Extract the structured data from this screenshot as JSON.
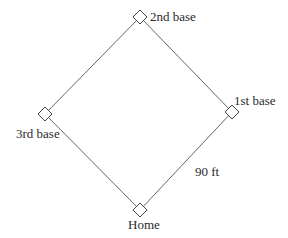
{
  "diagram": {
    "type": "baseball-diamond",
    "colors": {
      "line": "#555555",
      "text": "#2a2a2a",
      "background": "#ffffff"
    },
    "bases": [
      {
        "id": "second",
        "label": "2nd base",
        "cx": 140,
        "cy": 17
      },
      {
        "id": "first",
        "label": "1st base",
        "cx": 232,
        "cy": 112
      },
      {
        "id": "third",
        "label": "3rd base",
        "cx": 45,
        "cy": 114
      },
      {
        "id": "home",
        "label": "Home",
        "cx": 140,
        "cy": 210
      }
    ],
    "dimension_label": "90 ft"
  }
}
